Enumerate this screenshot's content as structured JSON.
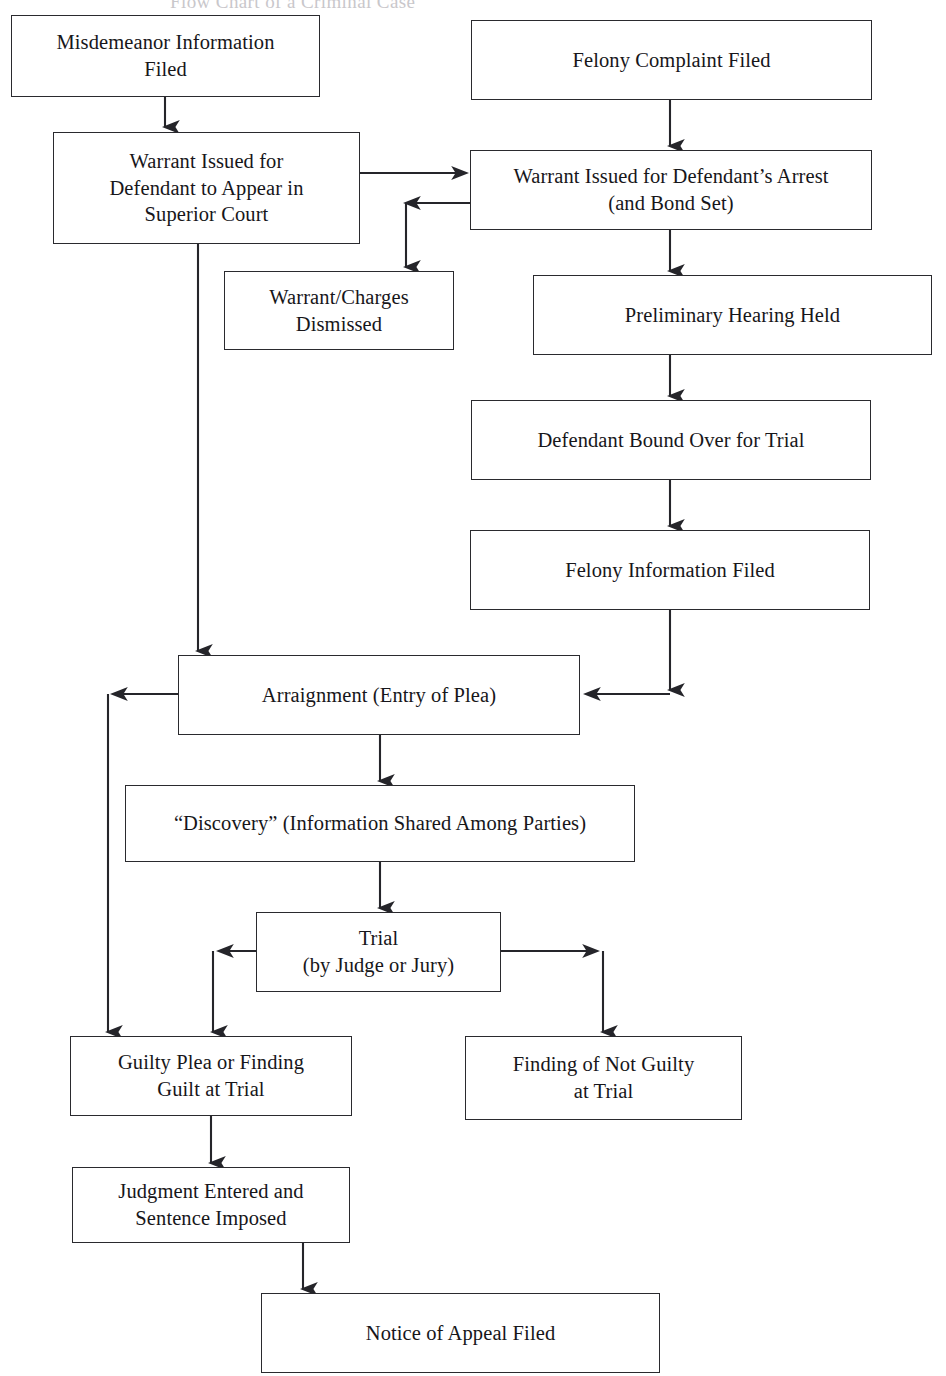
{
  "diagram": {
    "title_partial": "Flow Chart of a Criminal Case",
    "nodes": [
      {
        "id": "misdemeanor_information_filed",
        "label": "Misdemeanor Information\nFiled"
      },
      {
        "id": "felony_complaint_filed",
        "label": "Felony Complaint Filed"
      },
      {
        "id": "warrant_issued_appear_superior_court",
        "label": "Warrant Issued for\nDefendant to Appear in\nSuperior Court"
      },
      {
        "id": "warrant_issued_defendants_arrest",
        "label": "Warrant Issued for Defendant’s Arrest\n(and Bond Set)"
      },
      {
        "id": "warrant_charges_dismissed",
        "label": "Warrant/Charges\nDismissed"
      },
      {
        "id": "preliminary_hearing_held",
        "label": "Preliminary Hearing Held"
      },
      {
        "id": "defendant_bound_over_for_trial",
        "label": "Defendant Bound Over for Trial"
      },
      {
        "id": "felony_information_filed",
        "label": "Felony Information Filed"
      },
      {
        "id": "arraignment_entry_of_plea",
        "label": "Arraignment (Entry of Plea)"
      },
      {
        "id": "discovery_information_shared",
        "label": "“Discovery” (Information Shared Among Parties)"
      },
      {
        "id": "trial_by_judge_or_jury",
        "label": "Trial\n(by Judge or Jury)"
      },
      {
        "id": "guilty_plea_or_finding_guilt",
        "label": "Guilty Plea or Finding\nGuilt at Trial"
      },
      {
        "id": "finding_of_not_guilty_at_trial",
        "label": "Finding of Not Guilty\nat Trial"
      },
      {
        "id": "judgment_entered_sentence_imposed",
        "label": "Judgment Entered and\nSentence Imposed"
      },
      {
        "id": "notice_of_appeal_filed",
        "label": "Notice of Appeal Filed"
      }
    ],
    "edges": [
      {
        "from": "misdemeanor_information_filed",
        "to": "warrant_issued_appear_superior_court"
      },
      {
        "from": "felony_complaint_filed",
        "to": "warrant_issued_defendants_arrest"
      },
      {
        "from": "warrant_issued_appear_superior_court",
        "to": "warrant_issued_defendants_arrest"
      },
      {
        "from": "warrant_issued_defendants_arrest",
        "to": "warrant_charges_dismissed"
      },
      {
        "from": "warrant_issued_defendants_arrest",
        "to": "preliminary_hearing_held"
      },
      {
        "from": "preliminary_hearing_held",
        "to": "defendant_bound_over_for_trial"
      },
      {
        "from": "defendant_bound_over_for_trial",
        "to": "felony_information_filed"
      },
      {
        "from": "felony_information_filed",
        "to": "arraignment_entry_of_plea"
      },
      {
        "from": "warrant_issued_appear_superior_court",
        "to": "arraignment_entry_of_plea"
      },
      {
        "from": "arraignment_entry_of_plea",
        "to": "discovery_information_shared"
      },
      {
        "from": "arraignment_entry_of_plea",
        "to": "guilty_plea_or_finding_guilt"
      },
      {
        "from": "discovery_information_shared",
        "to": "trial_by_judge_or_jury"
      },
      {
        "from": "trial_by_judge_or_jury",
        "to": "guilty_plea_or_finding_guilt"
      },
      {
        "from": "trial_by_judge_or_jury",
        "to": "finding_of_not_guilty_at_trial"
      },
      {
        "from": "guilty_plea_or_finding_guilt",
        "to": "judgment_entered_sentence_imposed"
      },
      {
        "from": "judgment_entered_sentence_imposed",
        "to": "notice_of_appeal_filed"
      }
    ],
    "colors": {
      "background": "#ffffff",
      "box_border": "#2a2a2e",
      "text": "#17161a",
      "connector": "#25252a"
    }
  }
}
